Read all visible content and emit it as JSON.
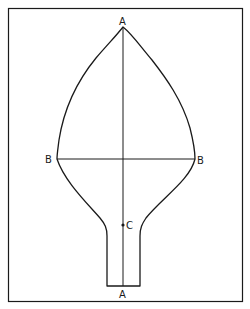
{
  "diagram": {
    "type": "geometric-outline",
    "labels": {
      "top_apex": "A",
      "bottom_end": "A",
      "left_widest": "B",
      "right_widest": "B",
      "center_point": "C"
    },
    "colors": {
      "line": "#1a1a1a",
      "background": "#ffffff"
    }
  }
}
